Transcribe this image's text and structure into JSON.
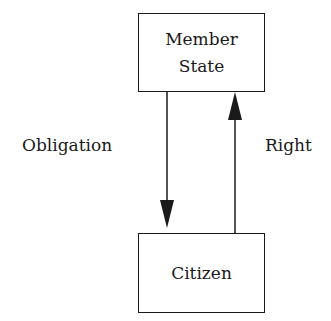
{
  "diagram": {
    "top_box": {
      "line1": "Member",
      "line2": "State"
    },
    "bottom_box": {
      "label": "Citizen"
    },
    "left_arrow": {
      "label": "Obligation",
      "direction": "down",
      "from": "Member State",
      "to": "Citizen"
    },
    "right_arrow": {
      "label": "Right",
      "direction": "up",
      "from": "Citizen",
      "to": "Member State"
    }
  }
}
